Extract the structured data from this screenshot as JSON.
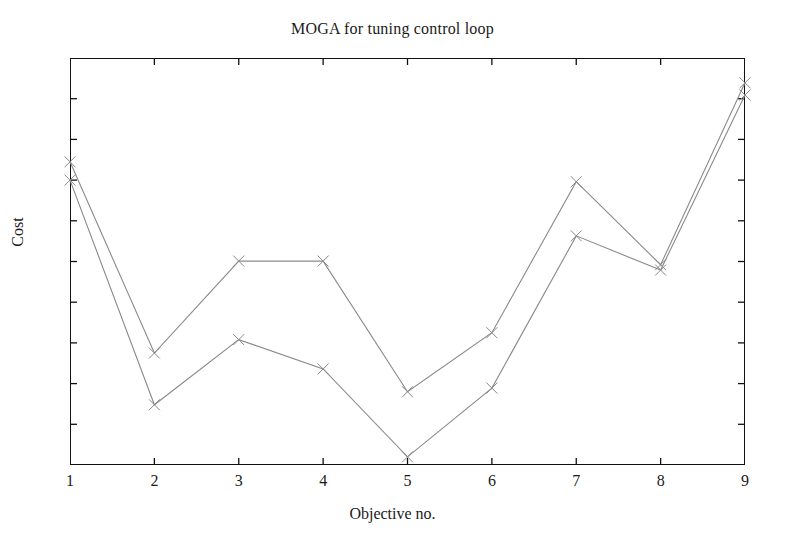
{
  "chart_data": {
    "type": "line",
    "title": "MOGA for tuning control loop",
    "xlabel": "Objective no.",
    "ylabel": "Cost",
    "grid": false,
    "legend": "none",
    "marker": "x",
    "x": [
      1,
      2,
      3,
      4,
      5,
      6,
      7,
      8,
      9
    ],
    "xtick_labels": [
      "1",
      "2",
      "3",
      "4",
      "5",
      "6",
      "7",
      "8",
      "9"
    ],
    "ytick_labels": [],
    "xlim": [
      1,
      9
    ],
    "ylim": [
      0,
      1
    ],
    "y_axis_note": "Cost axis has unlabeled tick marks only; values are normalized estimates read off tick spacing.",
    "series": [
      {
        "name": "upper-series",
        "color": "#8a8a8a",
        "values": [
          0.745,
          0.275,
          0.501,
          0.501,
          0.18,
          0.325,
          0.696,
          0.492,
          0.939
        ]
      },
      {
        "name": "lower-series",
        "color": "#8a8a8a",
        "values": [
          0.7,
          0.148,
          0.308,
          0.236,
          0.02,
          0.189,
          0.563,
          0.479,
          0.909
        ]
      }
    ]
  },
  "axes": {
    "x_major_ticks": 9,
    "y_major_ticks": 10,
    "frame_color": "#111111",
    "tick_color": "#111111"
  }
}
